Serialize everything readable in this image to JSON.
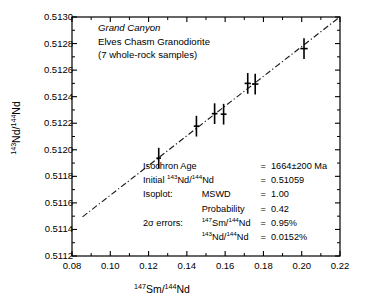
{
  "chart_data": {
    "type": "scatter",
    "xlabel": "147Sm/144Nd",
    "ylabel": "143Nd/144Nd",
    "xlim": [
      0.08,
      0.22
    ],
    "ylim": [
      0.5112,
      0.513
    ],
    "xticks": [
      "0.08",
      "0.10",
      "0.12",
      "0.14",
      "0.16",
      "0.18",
      "0.20",
      "0.22"
    ],
    "xtick_values": [
      0.08,
      0.1,
      0.12,
      0.14,
      0.16,
      0.18,
      0.2,
      0.22
    ],
    "yticks": [
      "0.5112",
      "0.5114",
      "0.5116",
      "0.5118",
      "0.5120",
      "0.5122",
      "0.5124",
      "0.5126",
      "0.5128",
      "0.5130"
    ],
    "ytick_values": [
      0.5112,
      0.5114,
      0.5116,
      0.5118,
      0.512,
      0.5122,
      0.5124,
      0.5126,
      0.5128,
      0.513
    ],
    "minor_ticks": true,
    "grid": false,
    "legend": "none",
    "points": [
      {
        "x": 0.1253,
        "y": 0.511937,
        "xerr": 0.00119,
        "yerr": 7.8e-05
      },
      {
        "x": 0.145,
        "y": 0.512178,
        "xerr": 0.00138,
        "yerr": 7.8e-05
      },
      {
        "x": 0.1545,
        "y": 0.512272,
        "xerr": 0.00147,
        "yerr": 7.8e-05
      },
      {
        "x": 0.1592,
        "y": 0.512268,
        "xerr": 0.00151,
        "yerr": 7.8e-05
      },
      {
        "x": 0.1718,
        "y": 0.5125,
        "xerr": 0.00163,
        "yerr": 7.8e-05
      },
      {
        "x": 0.1757,
        "y": 0.512495,
        "xerr": 0.00167,
        "yerr": 7.8e-05
      },
      {
        "x": 0.2012,
        "y": 0.512762,
        "xerr": 0.00191,
        "yerr": 7.8e-05
      }
    ],
    "fit_line": {
      "style": "dash-dot",
      "x0": 0.0855,
      "y0": 0.511495,
      "x1": 0.219,
      "y1": 0.51299
    }
  },
  "header": {
    "line1": "Grand Canyon",
    "line2": "Elves Chasm Granodiorite",
    "line3": "(7 whole-rock samples)"
  },
  "results": {
    "rows": [
      {
        "label": "Isochron Age",
        "sub": "",
        "eq": "=",
        "value": "1664±200 Ma"
      },
      {
        "label": "Initial",
        "sub": "",
        "eq": "=",
        "value": "0.51059",
        "label_iso": "143Nd/144Nd"
      },
      {
        "label": "Isoplot:",
        "sub": "MSWD",
        "eq": "=",
        "value": "1.00"
      },
      {
        "label": "",
        "sub": "Probability",
        "eq": "=",
        "value": "0.42"
      },
      {
        "label": "2σ errors:",
        "sub": "147Sm/144Nd",
        "eq": "=",
        "value": "0.95%"
      },
      {
        "label": "",
        "sub": "143Nd/144Nd",
        "eq": "=",
        "value": "0.0152%"
      }
    ]
  },
  "axis": {
    "x_title_pre": "147",
    "x_title_mid": "Sm/",
    "x_title_sup2": "144",
    "x_title_end": "Nd",
    "y_title_pre": "143",
    "y_title_mid": "Nd/",
    "y_title_sup2": "144",
    "y_title_end": "Nd"
  },
  "colors": {
    "axis": "#000000",
    "marker": "#000000",
    "line": "#1a1a1a",
    "background": "#ffffff"
  }
}
